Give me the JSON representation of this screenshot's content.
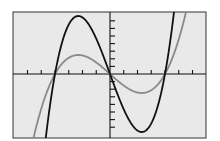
{
  "chart_data": {
    "type": "line",
    "title": "",
    "xlabel": "",
    "ylabel": "",
    "grid": false,
    "legend": null,
    "x_tick_spacing": 1,
    "x_ticks": [
      -6,
      -5,
      -4,
      -3,
      -2,
      -1,
      0,
      1,
      2,
      3,
      4,
      5,
      6
    ],
    "y_tick_count_each_side": 7,
    "xlim": [
      -7,
      7
    ],
    "series": [
      {
        "name": "black curve",
        "color": "#111111",
        "formula": "2.355 * x * (x^2 - 16) (pixel-scaled cubic)",
        "roots": [
          -4,
          0,
          4
        ],
        "local_max": {
          "x": -2.31,
          "y_px_above_axis": 58
        },
        "local_min": {
          "x": 2.31,
          "y_px_below_axis": 58
        }
      },
      {
        "name": "gray curve",
        "color": "#8a8a8a",
        "formula": "0.771 * x * (x^2 - 16) (pixel-scaled cubic)",
        "roots": [
          -4,
          0,
          4
        ],
        "local_max": {
          "x": -2.31,
          "y_px_above_axis": 19
        },
        "local_min": {
          "x": 2.31,
          "y_px_below_axis": 19
        }
      }
    ]
  },
  "colors": {
    "background": "#e9e9e9",
    "frame": "#333333",
    "axes": "#111111",
    "curve_dark": "#111111",
    "curve_gray": "#8a8a8a"
  },
  "labels": {
    "figure": "Graph of two cubic functions sharing roots"
  }
}
